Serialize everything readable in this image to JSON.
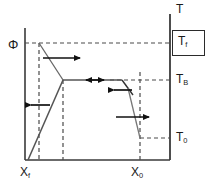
{
  "figure": {
    "type": "schematic-phase-diagram",
    "background": "#ffffff",
    "line_color": "#555555",
    "axis_color": "#3a3a3a",
    "dashed_color": "#4a4a4a",
    "arrow_color": "#111111"
  },
  "axes": {
    "y_left_label": "Φ",
    "y_right_label": "T",
    "x_axis": {
      "x_start": 25,
      "x_end": 170,
      "y": 160
    },
    "y_axis_left": {
      "x": 25,
      "y_top": 28,
      "y_bottom": 160
    },
    "y_axis_right": {
      "x": 170,
      "y_top": 14,
      "y_bottom": 160
    }
  },
  "temperature_labels": [
    {
      "name": "T_f",
      "text": "T",
      "sub": "f",
      "y": 43,
      "boxed": true
    },
    {
      "name": "T_B",
      "text": "T",
      "sub": "B",
      "y": 80,
      "boxed": false
    },
    {
      "name": "T_0",
      "text": "T",
      "sub": "0",
      "y": 138,
      "boxed": false
    }
  ],
  "composition_labels": [
    {
      "name": "X_f",
      "text": "X",
      "sub": "f",
      "x": 39
    },
    {
      "name": "X_0",
      "text": "X",
      "sub": "0",
      "x": 140
    }
  ],
  "dashed_guides": {
    "horizontal": [
      {
        "name": "guide-Tf",
        "y": 43,
        "x1": 25,
        "x2": 170
      },
      {
        "name": "guide-TB",
        "y": 80,
        "x1": 110,
        "x2": 170
      },
      {
        "name": "guide-T0",
        "y": 138,
        "x1": 140,
        "x2": 170
      }
    ],
    "vertical": [
      {
        "name": "guide-Xf",
        "x": 39,
        "y1": 43,
        "y2": 160
      },
      {
        "name": "guide-mid",
        "x": 63,
        "y1": 80,
        "y2": 160
      },
      {
        "name": "guide-X0",
        "x": 140,
        "y1": 72,
        "y2": 160
      }
    ]
  },
  "curves": [
    {
      "name": "curve-upper-branch",
      "points": "39,43 63,80"
    },
    {
      "name": "curve-plateau",
      "points": "63,80 122,80"
    },
    {
      "name": "curve-lower-branch",
      "points": "28,160 63,80"
    },
    {
      "name": "curve-right-notch",
      "points": "122,80 133,95"
    },
    {
      "name": "curve-right-drop",
      "points": "128,88 140,138"
    }
  ],
  "arrows": [
    {
      "name": "arrow-top-right",
      "direction": "right",
      "x1": 43,
      "y1": 58,
      "x2": 80,
      "y2": 58
    },
    {
      "name": "arrow-plateau-bidirectional",
      "direction": "both",
      "x1": 85,
      "y1": 80,
      "x2": 104,
      "y2": 80
    },
    {
      "name": "arrow-left-lower",
      "direction": "left",
      "x1": 50,
      "y1": 105,
      "x2": 30,
      "y2": 105
    },
    {
      "name": "arrow-notch-left",
      "direction": "left",
      "x1": 132,
      "y1": 90,
      "x2": 113,
      "y2": 90
    },
    {
      "name": "arrow-lower-right",
      "direction": "right",
      "x1": 116,
      "y1": 117,
      "x2": 150,
      "y2": 117
    }
  ]
}
